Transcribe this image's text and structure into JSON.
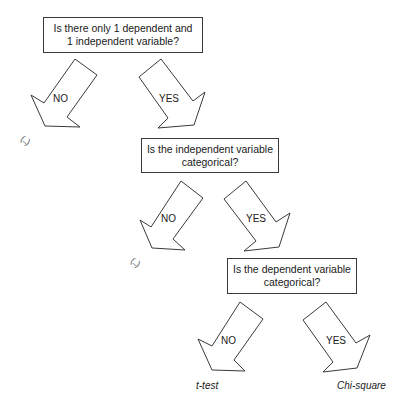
{
  "questions": [
    {
      "line1": "Is there only 1 dependent and",
      "line2": "1 independent variable?"
    },
    {
      "line1": "Is the independent variable",
      "line2": "categorical?"
    },
    {
      "line1": "Is the dependent variable",
      "line2": "categorical?"
    }
  ],
  "branches": [
    {
      "no_label": "NO",
      "yes_label": "YES",
      "no_outcome": "(...)"
    },
    {
      "no_label": "NO",
      "yes_label": "YES",
      "no_outcome": "(...)"
    },
    {
      "no_label": "NO",
      "yes_label": "YES"
    }
  ],
  "results": {
    "no": "t-test",
    "yes": "Chi-square"
  },
  "colors": {
    "stroke": "#3a3a3a",
    "background": "#ffffff"
  }
}
